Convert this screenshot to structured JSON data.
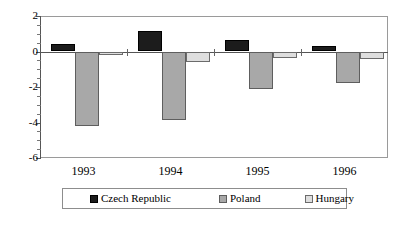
{
  "chart_data": {
    "type": "bar",
    "title": "",
    "subtitle": "",
    "xlabel": "",
    "ylabel": "",
    "categories": [
      "1993",
      "1994",
      "1995",
      "1996"
    ],
    "series": [
      {
        "name": "Czech Republic",
        "color": "#1c1c1c",
        "values": [
          0.45,
          1.15,
          0.65,
          0.3
        ]
      },
      {
        "name": "Poland",
        "color": "#a8a8a8",
        "values": [
          -4.2,
          -3.85,
          -2.1,
          -1.8
        ]
      },
      {
        "name": "Hungary",
        "color": "#dedede",
        "values": [
          -0.2,
          -0.6,
          -0.35,
          -0.45
        ]
      }
    ],
    "ylim": [
      -6,
      2
    ],
    "y_ticks": [
      2,
      0,
      -2,
      -4,
      -6
    ],
    "y_tick_labels": [
      "2",
      "0",
      "-2",
      "-4",
      "-6"
    ],
    "y_minor_step": 0.5,
    "grid": false,
    "legend_position": "bottom"
  },
  "legend": {
    "entries": [
      {
        "label": "Czech Republic"
      },
      {
        "label": "Poland"
      },
      {
        "label": "Hungary"
      }
    ]
  }
}
